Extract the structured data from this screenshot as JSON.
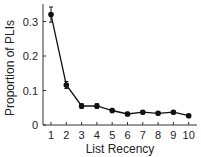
{
  "chart_data": {
    "type": "line",
    "title": "",
    "xlabel": "List Recency",
    "ylabel": "Proportion of PLIs",
    "x": [
      1,
      2,
      3,
      4,
      5,
      6,
      7,
      8,
      9,
      10
    ],
    "x_tick_labels": [
      "1",
      "2",
      "3",
      "4",
      "5",
      "6",
      "7",
      "8",
      "9",
      "10"
    ],
    "y_ticks": [
      0,
      0.1,
      0.2,
      0.3
    ],
    "y_tick_labels": [
      "0",
      "0.1",
      "0.2",
      "0.3"
    ],
    "ylim": [
      0,
      0.35
    ],
    "xlim": [
      0.5,
      10.5
    ],
    "grid": false,
    "legend": null,
    "series": [
      {
        "name": "PLI proportion",
        "values": [
          0.32,
          0.116,
          0.055,
          0.055,
          0.042,
          0.032,
          0.037,
          0.034,
          0.037,
          0.027
        ],
        "error": [
          0.022,
          0.01,
          0.007,
          0.007,
          0.006,
          0.005,
          0.005,
          0.005,
          0.005,
          0.004
        ],
        "color": "#111111",
        "marker": "circle"
      }
    ]
  }
}
